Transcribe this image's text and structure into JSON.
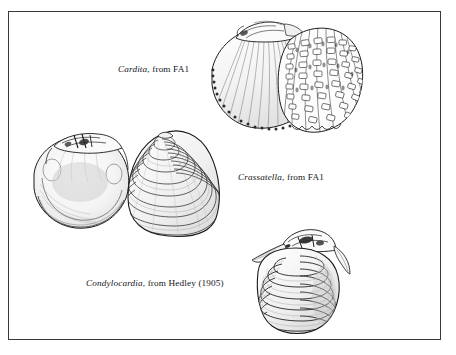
{
  "figure": {
    "type": "scientific-illustration-plate",
    "background_color": "#ffffff",
    "ink_color": "#15151a",
    "frame": {
      "border_color": "#3a3a3a",
      "border_width_px": 1
    }
  },
  "specimens": [
    {
      "id": "cardita",
      "genus": "Cardita",
      "caption_rest": ", from FA1",
      "caption_full": "Cardita, from FA1",
      "description": "bivalve shell in oblique view with scaly nodulose radial ribs and crenulate margin",
      "label_position": "left-of-figure"
    },
    {
      "id": "crassatella",
      "genus": "Crassatella",
      "caption_rest": ", from FA1",
      "caption_full": "Crassatella, from FA1",
      "description": "pair of shells, left valve interior with hinge teeth, right valve exterior with concentric ribs",
      "label_position": "right-of-figure"
    },
    {
      "id": "condylocardia",
      "genus": "Condylocardia",
      "caption_rest": ", from Hedley (1905)",
      "caption_full": "Condylocardia, from Hedley (1905)",
      "description": "small bivalve with strong concentric ridges and prominent hinge plate",
      "label_position": "left-of-figure"
    }
  ]
}
